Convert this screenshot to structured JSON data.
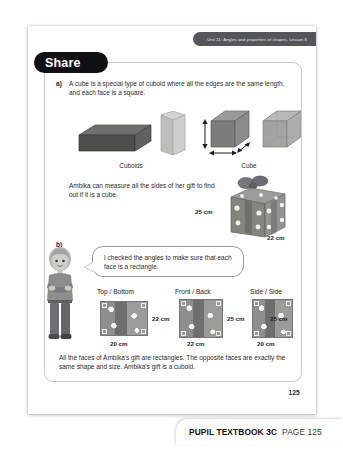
{
  "header": {
    "unit_banner": "Unit 11: Angles and properties of shapes, Lesson 8"
  },
  "section": {
    "title": "Share"
  },
  "part_a": {
    "marker": "a)",
    "text": "A cube is a special type of cuboid where all the edges are the same length, and each face is a square.",
    "figures": [
      {
        "caption": "Cuboids",
        "name": "cuboids-figure"
      },
      {
        "caption": "Cube",
        "name": "cube-figure"
      }
    ]
  },
  "ambika": {
    "text": "Ambika can measure all the sides of her gift to find out if it is a cube.",
    "gift_labels": {
      "height": "25 cm",
      "depth": "22 cm",
      "width": "20 cm"
    }
  },
  "part_b": {
    "marker": "b)",
    "speech": "I checked the angles to make sure that each face is a rectangle.",
    "faces": [
      {
        "title": "Top / Bottom",
        "side_label": "22 cm",
        "bottom_label": "20 cm"
      },
      {
        "title": "Front / Back",
        "side_label": "25 cm",
        "bottom_label": "22 cm"
      },
      {
        "title": "Side / Side",
        "side_label": "25 cm",
        "bottom_label": "20 cm"
      }
    ],
    "conclusion": "All the faces of Ambika's gift are rectangles. The opposite faces are exactly the same shape and size. Ambika's gift is a cuboid."
  },
  "footer": {
    "page_number": "125",
    "book_label": "PUPIL TEXTBOOK 3C",
    "page_label": "PAGE 125"
  },
  "colors": {
    "banner_bg": "#55565a",
    "tab_bg": "#111113",
    "frame_border": "#c9cacd",
    "text": "#2b2b2d"
  }
}
